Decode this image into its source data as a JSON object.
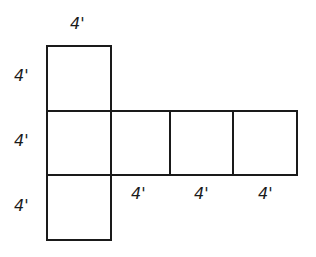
{
  "figure": {
    "kind": "geometry-net-diagram",
    "unit_symbol": "4'",
    "stroke_color": "#1a1a1a",
    "background_color": "#ffffff",
    "stroke_width_px": 2,
    "square_size_px": 63
  },
  "squares": [
    {
      "id": "top-square",
      "x": 47,
      "y": 46,
      "w": 64,
      "h": 65
    },
    {
      "id": "middle-square-1",
      "x": 47,
      "y": 111,
      "w": 64,
      "h": 64
    },
    {
      "id": "middle-square-2",
      "x": 111,
      "y": 111,
      "w": 59,
      "h": 64
    },
    {
      "id": "middle-square-3",
      "x": 170,
      "y": 111,
      "w": 63,
      "h": 64
    },
    {
      "id": "middle-square-4",
      "x": 233,
      "y": 111,
      "w": 64,
      "h": 64
    },
    {
      "id": "bottom-square",
      "x": 47,
      "y": 175,
      "w": 64,
      "h": 65
    }
  ],
  "labels": {
    "top": {
      "text": "4'",
      "name": "dimension-label-top",
      "x": 70,
      "y": 16
    },
    "left": [
      {
        "text": "4'",
        "name": "dimension-label-left-upper",
        "x": 14,
        "y": 68
      },
      {
        "text": "4'",
        "name": "dimension-label-left-middle",
        "x": 14,
        "y": 133
      },
      {
        "text": "4'",
        "name": "dimension-label-left-lower",
        "x": 14,
        "y": 198
      }
    ],
    "bottom": [
      {
        "text": "4'",
        "name": "dimension-label-bottom-first",
        "x": 131,
        "y": 186
      },
      {
        "text": "4'",
        "name": "dimension-label-bottom-second",
        "x": 194,
        "y": 186
      },
      {
        "text": "4'",
        "name": "dimension-label-bottom-third",
        "x": 258,
        "y": 186
      }
    ]
  }
}
